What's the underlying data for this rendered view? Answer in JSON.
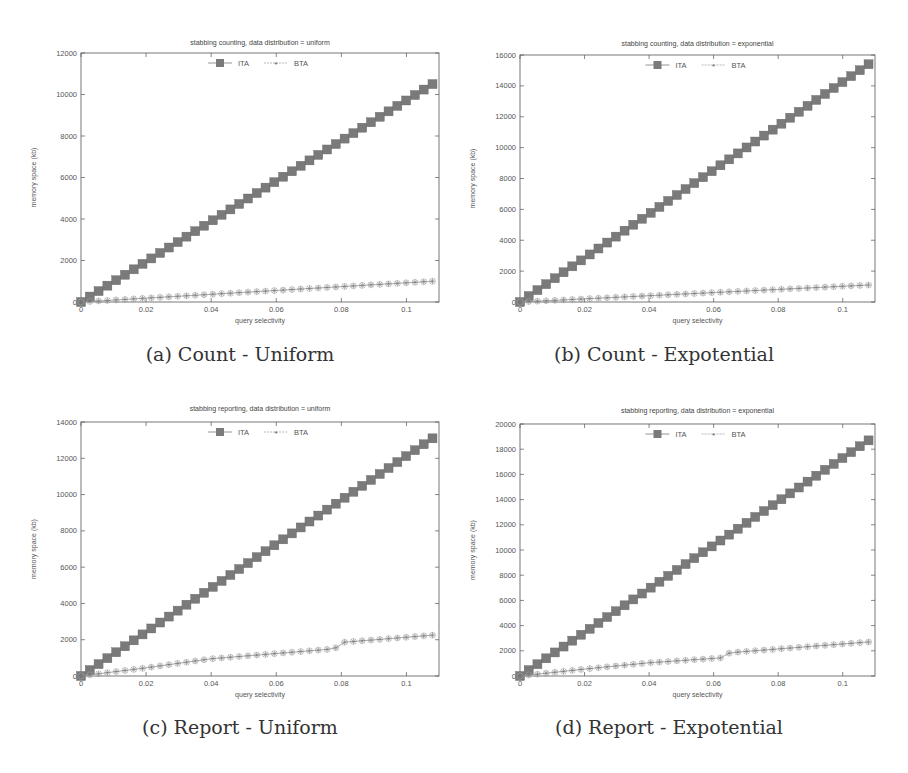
{
  "figure": {
    "panels": [
      {
        "id": "a",
        "caption": "(a) Count - Uniform",
        "title": "stabbing counting, data distribution = uniform"
      },
      {
        "id": "b",
        "caption": "(b) Count - Expotential",
        "title": "stabbing counting, data distribution = exponential"
      },
      {
        "id": "c",
        "caption": "(c) Report - Uniform",
        "title": "stabbing reporting, data distribution = uniform"
      },
      {
        "id": "d",
        "caption": "(d) Report - Expotential",
        "title": "stabbing reporting, data distribution = exponential"
      }
    ],
    "colors": {
      "ITA": "#7a7a7a",
      "BTA": "#8a8a8a",
      "axis": "#555555",
      "text": "#444444"
    }
  },
  "chart_data": [
    {
      "type": "line",
      "title": "stabbing counting, data distribution = uniform",
      "caption": "(a) Count - Uniform",
      "xlabel": "query selectivity",
      "ylabel": "memory space (kb)",
      "xlim": [
        0,
        0.11
      ],
      "ylim": [
        0,
        12000
      ],
      "xticks": [
        "0",
        "0.02",
        "0.04",
        "0.06",
        "0.08",
        "0.1"
      ],
      "yticks": [
        "0",
        "2000",
        "4000",
        "6000",
        "8000",
        "10000",
        "12000"
      ],
      "legend": [
        "ITA",
        "BTA"
      ],
      "legend_position": "top-center",
      "series": [
        {
          "name": "ITA",
          "marker": "filled-square",
          "x_start": 0,
          "x_end": 0.108,
          "points": 41,
          "y_start": 0,
          "y_end": 10500
        },
        {
          "name": "BTA",
          "marker": "asterisk",
          "x_start": 0,
          "x_end": 0.108,
          "points": 41,
          "y_start": 0,
          "y_end": 1000
        }
      ]
    },
    {
      "type": "line",
      "title": "stabbing counting, data distribution = exponential",
      "caption": "(b) Count - Expotential",
      "xlabel": "query selectivity",
      "ylabel": "memory space (kb)",
      "xlim": [
        0,
        0.11
      ],
      "ylim": [
        0,
        16000
      ],
      "xticks": [
        "0",
        "0.02",
        "0.04",
        "0.06",
        "0.08",
        "0.1"
      ],
      "yticks": [
        "0",
        "2000",
        "4000",
        "6000",
        "8000",
        "10000",
        "12000",
        "14000",
        "16000"
      ],
      "legend": [
        "ITA",
        "BTA"
      ],
      "legend_position": "top-center",
      "series": [
        {
          "name": "ITA",
          "marker": "filled-square",
          "x_start": 0,
          "x_end": 0.108,
          "points": 41,
          "y_start": 0,
          "y_end": 15400
        },
        {
          "name": "BTA",
          "marker": "asterisk",
          "x_start": 0,
          "x_end": 0.108,
          "points": 41,
          "y_start": 0,
          "y_end": 1100
        }
      ]
    },
    {
      "type": "line",
      "title": "stabbing reporting, data distribution = uniform",
      "caption": "(c) Report - Uniform",
      "xlabel": "query selectivity",
      "ylabel": "memory space (kb)",
      "xlim": [
        0,
        0.11
      ],
      "ylim": [
        0,
        14000
      ],
      "xticks": [
        "0",
        "0.02",
        "0.04",
        "0.06",
        "0.08",
        "0.1"
      ],
      "yticks": [
        "0",
        "2000",
        "4000",
        "6000",
        "8000",
        "10000",
        "12000",
        "14000"
      ],
      "legend": [
        "ITA",
        "BTA"
      ],
      "legend_position": "top-center",
      "series": [
        {
          "name": "ITA",
          "marker": "filled-square",
          "x_start": 0,
          "x_end": 0.108,
          "points": 41,
          "y_start": 0,
          "y_end": 13100
        },
        {
          "name": "BTA",
          "marker": "asterisk",
          "x_start": 0,
          "x_end": 0.108,
          "points": 41,
          "keypoints": [
            [
              0,
              0
            ],
            [
              0.02,
              450
            ],
            [
              0.04,
              950
            ],
            [
              0.078,
              1500
            ],
            [
              0.08,
              1850
            ],
            [
              0.108,
              2250
            ]
          ]
        }
      ]
    },
    {
      "type": "line",
      "title": "stabbing reporting, data distribution = exponential",
      "caption": "(d) Report - Expotential",
      "xlabel": "query selectivity",
      "ylabel": "memory space (kb)",
      "xlim": [
        0,
        0.11
      ],
      "ylim": [
        0,
        20000
      ],
      "xticks": [
        "0",
        "0.02",
        "0.04",
        "0.06",
        "0.08",
        "0.1"
      ],
      "yticks": [
        "0",
        "2000",
        "4000",
        "6000",
        "8000",
        "10000",
        "12000",
        "14000",
        "16000",
        "18000",
        "20000"
      ],
      "legend": [
        "ITA",
        "BTA"
      ],
      "legend_position": "top-center",
      "series": [
        {
          "name": "ITA",
          "marker": "filled-square",
          "x_start": 0,
          "x_end": 0.108,
          "points": 41,
          "y_start": 0,
          "y_end": 18700
        },
        {
          "name": "BTA",
          "marker": "asterisk",
          "x_start": 0,
          "x_end": 0.108,
          "points": 41,
          "keypoints": [
            [
              0,
              0
            ],
            [
              0.02,
              550
            ],
            [
              0.04,
              1050
            ],
            [
              0.063,
              1450
            ],
            [
              0.065,
              1850
            ],
            [
              0.108,
              2700
            ]
          ]
        }
      ]
    }
  ]
}
